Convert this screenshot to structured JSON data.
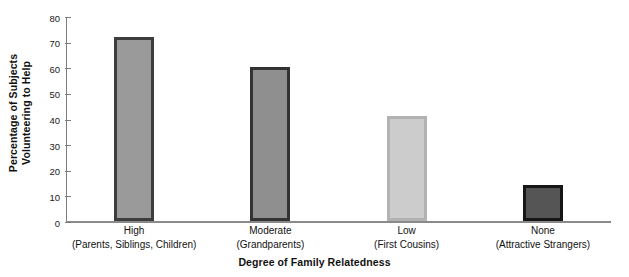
{
  "chart_data": {
    "type": "bar",
    "title": "",
    "xlabel": "Degree of Family Relatedness",
    "ylabel_lines": [
      "Percentage of Subjects",
      "Volunteering to Help"
    ],
    "categories": [
      "High",
      "Moderate",
      "Low",
      "None"
    ],
    "category_sublabels": [
      "(Parents, Siblings, Children)",
      "(Grandparents)",
      "(First Cousins)",
      "(Attractive Strangers)"
    ],
    "values": [
      72,
      60,
      41,
      14
    ],
    "ylim": [
      0,
      80
    ],
    "yticks": [
      0,
      10,
      20,
      30,
      40,
      50,
      60,
      70,
      80
    ],
    "ytick_labels": [
      "0",
      "10",
      "20",
      "30",
      "40",
      "50",
      "60",
      "70",
      "80"
    ],
    "grid": false,
    "legend": "none",
    "bar_fill_colors": [
      "#9a9a9a",
      "#8f8f8f",
      "#cccccc",
      "#555555"
    ],
    "bar_border_colors": [
      "#3d3d3d",
      "#333333",
      "#b2b2b2",
      "#161616"
    ],
    "axis_color": "#808080",
    "background_color": "#ffffff"
  }
}
